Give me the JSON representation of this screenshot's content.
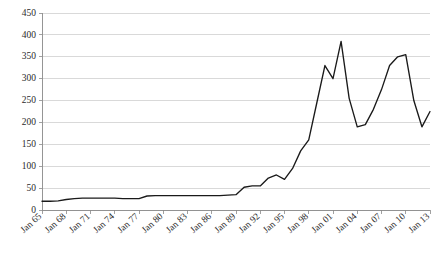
{
  "chart_data": {
    "type": "line",
    "title": "",
    "subtitle": "",
    "xlabel": "",
    "ylabel": "",
    "ylim": [
      0,
      450
    ],
    "ytick_values": [
      0,
      50,
      100,
      150,
      200,
      250,
      300,
      350,
      400,
      450
    ],
    "ytick_labels": [
      "0",
      "50",
      "100",
      "150",
      "200",
      "250",
      "300",
      "350",
      "400",
      "450"
    ],
    "grid": true,
    "legend": "none",
    "xtick_labels": [
      "Jan 65",
      "Jan 68",
      "Jan 71",
      "Jan 74",
      "Jan 77",
      "Jan 80",
      "Jan 83",
      "Jan 86",
      "Jan 89",
      "Jan 92",
      "Jan 95",
      "Jan 98",
      "Jan 01",
      "Jan 04",
      "Jan 07",
      "Jan 10",
      "Jan 13"
    ],
    "x": [
      "Jan 65",
      "Jan 66",
      "Jan 67",
      "Jan 68",
      "Jan 69",
      "Jan 70",
      "Jan 71",
      "Jan 72",
      "Jan 73",
      "Jan 74",
      "Jan 75",
      "Jan 76",
      "Jan 77",
      "Jan 78",
      "Jan 79",
      "Jan 80",
      "Jan 81",
      "Jan 82",
      "Jan 83",
      "Jan 84",
      "Jan 85",
      "Jan 86",
      "Jan 87",
      "Jan 88",
      "Jan 89",
      "Jan 90",
      "Jan 91",
      "Jan 92",
      "Jan 93",
      "Jan 94",
      "Jan 95",
      "Jan 96",
      "Jan 97",
      "Jan 98",
      "Jan 99",
      "Jan 00",
      "Jan 01",
      "Jan 02",
      "Jan 03",
      "Jan 04",
      "Jan 05",
      "Jan 06",
      "Jan 07",
      "Jan 08",
      "Jan 09",
      "Jan 10",
      "Jan 11",
      "Jan 12",
      "Jan 13"
    ],
    "values": [
      20,
      20,
      21,
      24,
      26,
      27,
      27,
      27,
      27,
      27,
      26,
      26,
      26,
      32,
      33,
      33,
      33,
      33,
      33,
      33,
      33,
      33,
      33,
      34,
      35,
      52,
      55,
      55,
      73,
      80,
      70,
      95,
      135,
      160,
      245,
      330,
      300,
      385,
      255,
      190,
      195,
      230,
      275,
      330,
      350,
      355,
      250,
      190,
      225
    ],
    "series_name": "value",
    "x_axis_range": [
      "Jan 65",
      "Jan 13"
    ],
    "note_line_points_count": 49
  }
}
